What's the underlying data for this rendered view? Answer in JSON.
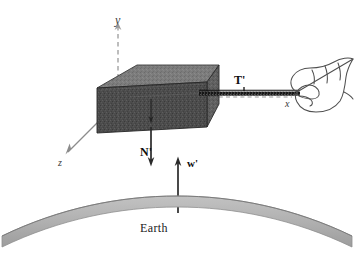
{
  "figure": {
    "background_color": "#ffffff"
  },
  "axes": {
    "y": {
      "label": "y",
      "style": "dashed",
      "direction": "up",
      "color": "#9a9a9a"
    },
    "x": {
      "label": "x",
      "style": "dashed",
      "direction": "right",
      "color": "#9a9a9a"
    },
    "z": {
      "label": "z",
      "style": "solid",
      "direction": "down-left",
      "color": "#8c8c8c"
    }
  },
  "forces": [
    {
      "name": "tension",
      "label": "T'",
      "direction": "right",
      "color": "#111111"
    },
    {
      "name": "normal",
      "label": "N'",
      "direction": "down",
      "color": "#2a2a2a"
    },
    {
      "name": "weight",
      "label": "w'",
      "direction": "up",
      "color": "#2a2a2a"
    }
  ],
  "objects": {
    "block": {
      "name": "block",
      "top_face_color": "#7c7c7c",
      "front_face_color": "#4a4a4a",
      "side_face_color": "#5e5e5e",
      "edge_color": "#2b2b2b"
    },
    "rope": {
      "name": "rope",
      "color": "#1a1a1a"
    },
    "hand": {
      "name": "hand",
      "stroke_color": "#4a4a4a"
    },
    "earth": {
      "name": "earth",
      "label": "Earth",
      "fill_color": "#b0b0b0",
      "stroke_color": "#8a8a8a"
    }
  }
}
